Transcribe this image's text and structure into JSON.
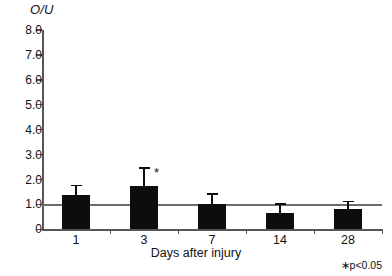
{
  "chart_data": {
    "type": "bar",
    "title": "",
    "ylabel": "O/U",
    "xlabel": "Days after injury",
    "categories": [
      "1",
      "3",
      "7",
      "14",
      "28"
    ],
    "values": [
      1.4,
      1.75,
      1.0,
      0.65,
      0.82
    ],
    "errors_upper": [
      0.4,
      0.75,
      0.45,
      0.4,
      0.33
    ],
    "significance": [
      "",
      "*",
      "",
      "",
      ""
    ],
    "ylim": [
      0,
      8.0
    ],
    "ytick_labels": [
      "0",
      "1.0",
      "2.0",
      "3.0",
      "4.0",
      "5.0",
      "6.0",
      "7.0",
      "8.0"
    ],
    "ytick_values": [
      0,
      1,
      2,
      3,
      4,
      5,
      6,
      7,
      8
    ],
    "reference_line": 1.0,
    "grid": false,
    "legend": "none",
    "footnote": "∗p<0.05",
    "bar_color": "#0d0d0d",
    "axis_color": "#555555"
  }
}
